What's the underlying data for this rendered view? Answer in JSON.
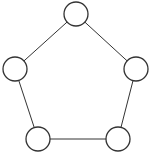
{
  "diagram": {
    "type": "graph",
    "shape": "pentagon-cycle",
    "nodes": [
      {
        "id": "n1",
        "label": "",
        "cx": 76,
        "cy": 14,
        "r": 12
      },
      {
        "id": "n2",
        "label": "",
        "cx": 136,
        "cy": 69,
        "r": 12
      },
      {
        "id": "n3",
        "label": "",
        "cx": 118,
        "cy": 139,
        "r": 12
      },
      {
        "id": "n4",
        "label": "",
        "cx": 38,
        "cy": 139,
        "r": 12
      },
      {
        "id": "n5",
        "label": "",
        "cx": 15,
        "cy": 69,
        "r": 12
      }
    ],
    "edges": [
      {
        "from": "n1",
        "to": "n2"
      },
      {
        "from": "n2",
        "to": "n3"
      },
      {
        "from": "n3",
        "to": "n4"
      },
      {
        "from": "n4",
        "to": "n5"
      },
      {
        "from": "n5",
        "to": "n1"
      }
    ],
    "colors": {
      "stroke": "#333333",
      "fill": "#ffffff",
      "background": "#ffffff"
    }
  }
}
